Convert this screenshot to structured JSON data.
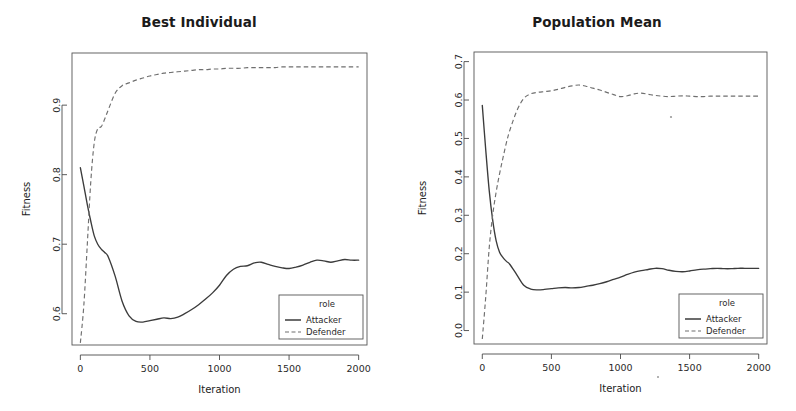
{
  "figure": {
    "background": "#ffffff",
    "width": 796,
    "height": 411,
    "panel_count": 2
  },
  "colors": {
    "attacker": "#3b3b3b",
    "defender": "#6f6f6f",
    "axis": "#4a4a4a",
    "text": "#1b1b1b",
    "background": "#ffffff"
  },
  "panels": [
    {
      "id": "best-individual",
      "title": "Best Individual",
      "xlabel": "Iteration",
      "ylabel": "Fitness",
      "legend_title": "role"
    },
    {
      "id": "population-mean",
      "title": "Population Mean",
      "xlabel": "Iteration",
      "ylabel": "Fitness",
      "legend_title": "role"
    }
  ],
  "chart_data": [
    {
      "type": "line",
      "title": "Best Individual",
      "xlabel": "Iteration",
      "ylabel": "Fitness",
      "xlim": [
        -60,
        2060
      ],
      "ylim": [
        0.555,
        0.975
      ],
      "xticks": [
        0,
        500,
        1000,
        1500,
        2000
      ],
      "xticklabels": [
        "0",
        "500",
        "1000",
        "1500",
        "2000"
      ],
      "yticks": [
        0.6,
        0.7,
        0.8,
        0.9
      ],
      "yticklabels": [
        "0.6",
        "0.7",
        "0.8",
        "0.9"
      ],
      "grid": false,
      "legend_position": "bottom-right",
      "legend_title": "role",
      "x": [
        0,
        25,
        50,
        75,
        100,
        125,
        150,
        175,
        200,
        250,
        300,
        350,
        400,
        450,
        500,
        550,
        600,
        650,
        700,
        750,
        800,
        850,
        900,
        950,
        1000,
        1050,
        1100,
        1150,
        1200,
        1250,
        1300,
        1350,
        1400,
        1450,
        1500,
        1550,
        1600,
        1650,
        1700,
        1750,
        1800,
        1850,
        1900,
        1950,
        2000
      ],
      "series": [
        {
          "name": "Attacker",
          "style": "solid",
          "color": "#3b3b3b",
          "values": [
            0.81,
            0.784,
            0.757,
            0.733,
            0.712,
            0.7,
            0.693,
            0.688,
            0.682,
            0.654,
            0.618,
            0.597,
            0.589,
            0.588,
            0.59,
            0.592,
            0.594,
            0.593,
            0.595,
            0.6,
            0.606,
            0.613,
            0.621,
            0.63,
            0.641,
            0.655,
            0.664,
            0.668,
            0.669,
            0.673,
            0.674,
            0.671,
            0.668,
            0.666,
            0.665,
            0.667,
            0.67,
            0.674,
            0.677,
            0.676,
            0.674,
            0.676,
            0.678,
            0.677,
            0.677
          ]
        },
        {
          "name": "Defender",
          "style": "dashed",
          "color": "#6f6f6f",
          "values": [
            0.558,
            0.612,
            0.7,
            0.79,
            0.846,
            0.866,
            0.869,
            0.88,
            0.893,
            0.917,
            0.928,
            0.932,
            0.936,
            0.939,
            0.942,
            0.944,
            0.946,
            0.947,
            0.948,
            0.949,
            0.95,
            0.951,
            0.951,
            0.952,
            0.952,
            0.953,
            0.953,
            0.953,
            0.954,
            0.954,
            0.954,
            0.954,
            0.954,
            0.955,
            0.955,
            0.955,
            0.955,
            0.955,
            0.955,
            0.955,
            0.955,
            0.955,
            0.955,
            0.955,
            0.955
          ]
        }
      ]
    },
    {
      "type": "line",
      "title": "Population Mean",
      "xlabel": "Iteration",
      "ylabel": "Fitness",
      "xlim": [
        -60,
        2060
      ],
      "ylim": [
        -0.035,
        0.725
      ],
      "xticks": [
        0,
        500,
        1000,
        1500,
        2000
      ],
      "xticklabels": [
        "0",
        "500",
        "1000",
        "1500",
        "2000"
      ],
      "yticks": [
        0.0,
        0.1,
        0.2,
        0.3,
        0.4,
        0.5,
        0.6,
        0.7
      ],
      "yticklabels": [
        "0.0",
        "0.1",
        "0.2",
        "0.3",
        "0.4",
        "0.5",
        "0.6",
        "0.7"
      ],
      "grid": false,
      "legend_position": "bottom-right",
      "legend_title": "role",
      "x": [
        0,
        25,
        50,
        75,
        100,
        125,
        150,
        175,
        200,
        250,
        300,
        350,
        400,
        450,
        500,
        550,
        600,
        650,
        700,
        750,
        800,
        850,
        900,
        950,
        1000,
        1050,
        1100,
        1150,
        1200,
        1250,
        1300,
        1350,
        1400,
        1450,
        1500,
        1550,
        1600,
        1650,
        1700,
        1750,
        1800,
        1850,
        1900,
        1950,
        2000
      ],
      "series": [
        {
          "name": "Attacker",
          "style": "solid",
          "color": "#3b3b3b",
          "values": [
            0.586,
            0.47,
            0.365,
            0.288,
            0.234,
            0.204,
            0.19,
            0.18,
            0.172,
            0.145,
            0.118,
            0.108,
            0.106,
            0.107,
            0.109,
            0.111,
            0.112,
            0.111,
            0.112,
            0.115,
            0.118,
            0.122,
            0.127,
            0.133,
            0.139,
            0.146,
            0.152,
            0.156,
            0.159,
            0.162,
            0.161,
            0.157,
            0.154,
            0.153,
            0.155,
            0.158,
            0.16,
            0.161,
            0.162,
            0.161,
            0.161,
            0.162,
            0.162,
            0.162,
            0.162
          ]
        },
        {
          "name": "Defender",
          "style": "dashed",
          "color": "#6f6f6f",
          "values": [
            -0.022,
            0.088,
            0.215,
            0.3,
            0.36,
            0.408,
            0.45,
            0.49,
            0.522,
            0.572,
            0.604,
            0.616,
            0.62,
            0.622,
            0.624,
            0.628,
            0.633,
            0.637,
            0.639,
            0.636,
            0.631,
            0.626,
            0.62,
            0.614,
            0.609,
            0.611,
            0.616,
            0.618,
            0.615,
            0.612,
            0.61,
            0.609,
            0.61,
            0.611,
            0.61,
            0.609,
            0.609,
            0.61,
            0.61,
            0.61,
            0.61,
            0.61,
            0.61,
            0.61,
            0.61
          ]
        }
      ]
    }
  ],
  "legend": {
    "title": "role",
    "entries": [
      {
        "label": "Attacker",
        "style": "solid"
      },
      {
        "label": "Defender",
        "style": "dashed"
      }
    ]
  }
}
